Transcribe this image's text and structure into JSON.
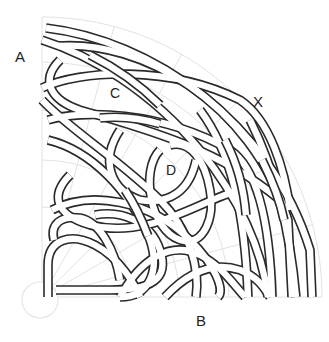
{
  "diagram": {
    "type": "knot-quadrant",
    "labels": {
      "a": "A",
      "b": "B",
      "c": "C",
      "d": "D",
      "x": "X"
    },
    "colors": {
      "background": "#ffffff",
      "band_outline": "#2a2a2a",
      "band_fill": "#ffffff",
      "grid": "#e2e2e2",
      "origin_circle": "#e6e6e6",
      "label": "#222222"
    },
    "geometry": {
      "origin": [
        42,
        297
      ],
      "radius": 280,
      "band_width": 8,
      "outline_width": 1.6
    }
  }
}
